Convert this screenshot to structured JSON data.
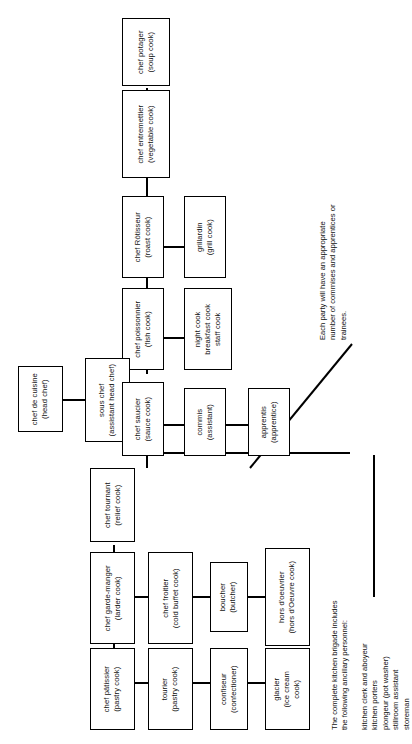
{
  "diagram": {
    "orientation": "rotated-90-ccw",
    "nodes": {
      "chef_de_cuisine": "chef de cuisine\n(head chef)",
      "sous_chef": "sous chef\n(assistant head chef)",
      "chef_potager": "chef potager\n(soup cook)",
      "chef_entremettier": "chef entremettier\n(vegetable cook)",
      "chef_rotisseur": "chef Rôtisseur\n(roast cook)",
      "grillardin": "grillardin\n(grill cook)",
      "chef_poissonnier": "chef poissonnier\n(fish cook)",
      "night_staff": "night cook\nbreakfast cook\nstaff cook",
      "chef_saucier": "chef saucier\n(sauce cook)",
      "commis": "commis\n(assistant)",
      "apprentis": "apprentis\n(apprentice)",
      "chef_tournant": "chef tournant\n(relief cook)",
      "chef_garde_manger": "chef garde-manger\n(larder cook)",
      "chef_froitier": "chef froitier\n(cold buffet cook)",
      "boucher": "boucher\n(butcher)",
      "hors_doeuvrier": "hors d'oeuvrier\n(hors d'Oeuvre cook)",
      "chef_patissier": "chef pâtissier\n(pastry cook)",
      "tourier": "tourier\n(pastry cook)",
      "confiseur": "confiseur\n(confectioner)",
      "glacier": "glacier\n(ice cream\ncook)"
    },
    "annotations": {
      "each_party": "Each party will have an appropriate\nnumber of commises and apprentices or\ntrainees.",
      "ancillary_intro": "The complete kitchen brigade includes\nthe following ancillary personnel:",
      "ancillary_list": "kitchen clerk and aboyeur\nkitchen porters\nplongeur (pot washer)\nstillroom assistant\nstoreman"
    },
    "colors": {
      "ink": "#000000",
      "paper": "#ffffff"
    }
  }
}
